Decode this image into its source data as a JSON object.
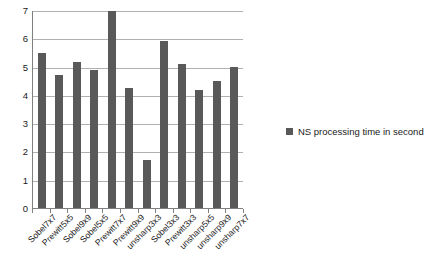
{
  "chart_data": {
    "type": "bar",
    "title": "",
    "subtitle": "",
    "xlabel": "",
    "ylabel": "",
    "categories": [
      "Sobel7x7",
      "Prewitt5x5",
      "Sobel9x9",
      "Sobel5x5",
      "Prewitt7x7",
      "Prewitt9x9",
      "unsharp3x3",
      "Sobel3x3",
      "Prewitt3x3",
      "unsharp5x5",
      "unsharp9x9",
      "unsharp7x7"
    ],
    "values": [
      5.5,
      4.72,
      5.2,
      4.9,
      7.0,
      4.25,
      1.72,
      5.95,
      5.12,
      4.18,
      4.5,
      5.02
    ],
    "series": [
      {
        "name": "NS processing time in second",
        "values": [
          5.5,
          4.72,
          5.2,
          4.9,
          7.0,
          4.25,
          1.72,
          5.95,
          5.12,
          4.18,
          4.5,
          5.02
        ],
        "color": "#595959"
      }
    ],
    "ylim": [
      0,
      7
    ],
    "ytick_labels": [
      "7",
      "6",
      "5",
      "4",
      "3",
      "2",
      "1",
      "0"
    ],
    "ytick_values": [
      7,
      6,
      5,
      4,
      3,
      2,
      1,
      0
    ],
    "grid": "horizontal",
    "legend_position": "right",
    "legend": [
      {
        "label": "NS processing time in second",
        "color": "#595959",
        "marker": "square-swatch"
      }
    ],
    "colors": {
      "bar": "#595959",
      "gridline": "#b0b0b0",
      "axis": "#808080",
      "text": "#1a1a1a",
      "background": "#ffffff"
    }
  }
}
